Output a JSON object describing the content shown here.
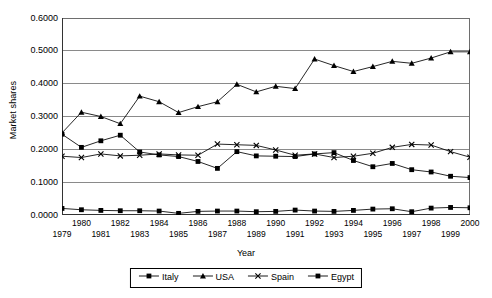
{
  "chart_data": {
    "type": "line",
    "title": "",
    "xlabel": "Year",
    "ylabel": "Market shares",
    "x": [
      1979,
      1980,
      1981,
      1982,
      1983,
      1984,
      1985,
      1986,
      1987,
      1988,
      1989,
      1990,
      1991,
      1992,
      1993,
      1994,
      1995,
      1996,
      1997,
      1998,
      1999,
      2000
    ],
    "xlim": [
      1979,
      2000
    ],
    "ylim": [
      0.0,
      0.6
    ],
    "yticks": [
      "0.0000",
      "0.1000",
      "0.2000",
      "0.3000",
      "0.4000",
      "0.5000",
      "0.6000"
    ],
    "ytick_values": [
      0.0,
      0.1,
      0.2,
      0.3,
      0.4,
      0.5,
      0.6
    ],
    "xtick_labels_row0": [
      "1980",
      "1982",
      "1984",
      "1986",
      "1988",
      "1990",
      "1992",
      "1994",
      "1996",
      "1998",
      "2000"
    ],
    "xtick_labels_row1": [
      "1979",
      "1981",
      "1983",
      "1985",
      "1987",
      "1989",
      "1991",
      "1993",
      "1995",
      "1997",
      "1999"
    ],
    "grid": "horizontal",
    "legend_position": "bottom-center",
    "series": [
      {
        "name": "Italy",
        "marker": "square",
        "color": "#000000",
        "values": [
          0.246,
          0.206,
          0.226,
          0.243,
          0.192,
          0.183,
          0.178,
          0.163,
          0.142,
          0.193,
          0.18,
          0.179,
          0.178,
          0.186,
          0.19,
          0.166,
          0.147,
          0.157,
          0.138,
          0.131,
          0.118,
          0.114
        ]
      },
      {
        "name": "USA",
        "marker": "triangle",
        "color": "#000000",
        "values": [
          0.25,
          0.313,
          0.3,
          0.278,
          0.362,
          0.345,
          0.312,
          0.33,
          0.345,
          0.398,
          0.375,
          0.392,
          0.385,
          0.475,
          0.455,
          0.437,
          0.452,
          0.468,
          0.462,
          0.478,
          0.497,
          0.497
        ]
      },
      {
        "name": "Spain",
        "marker": "cross",
        "color": "#000000",
        "values": [
          0.179,
          0.175,
          0.186,
          0.18,
          0.182,
          0.186,
          0.183,
          0.182,
          0.216,
          0.214,
          0.212,
          0.198,
          0.182,
          0.186,
          0.175,
          0.179,
          0.188,
          0.206,
          0.215,
          0.213,
          0.193,
          0.176
        ]
      },
      {
        "name": "Egypt",
        "marker": "square",
        "color": "#000000",
        "values": [
          0.02,
          0.016,
          0.014,
          0.013,
          0.013,
          0.012,
          0.005,
          0.011,
          0.012,
          0.012,
          0.01,
          0.011,
          0.015,
          0.012,
          0.011,
          0.014,
          0.018,
          0.019,
          0.01,
          0.021,
          0.023,
          0.022
        ]
      }
    ]
  },
  "legend": {
    "items": [
      {
        "label": "Italy",
        "marker": "square"
      },
      {
        "label": "USA",
        "marker": "triangle"
      },
      {
        "label": "Spain",
        "marker": "cross"
      },
      {
        "label": "Egypt",
        "marker": "square"
      }
    ]
  }
}
